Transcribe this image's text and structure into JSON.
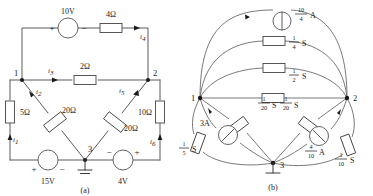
{
  "figure": {
    "panels": [
      {
        "id": "a",
        "caption": "(a)",
        "type": "resistive-network-with-voltage-sources",
        "nodes": [
          {
            "label": "1"
          },
          {
            "label": "2"
          },
          {
            "label": "3"
          }
        ],
        "sources": [
          {
            "name": "source-10v",
            "value": "10V",
            "plus": "+",
            "minus": "−",
            "orientation": "horizontal-top",
            "plus_side": "left"
          },
          {
            "name": "source-15v",
            "value": "15V",
            "plus": "+",
            "minus": "−",
            "orientation": "horizontal-bottom-left",
            "plus_side": "left"
          },
          {
            "name": "source-4v",
            "value": "4V",
            "plus": "+",
            "minus": "−",
            "orientation": "horizontal-bottom-right",
            "plus_side": "right"
          }
        ],
        "resistors": [
          {
            "name": "resistor-4ohm",
            "value": "4Ω"
          },
          {
            "name": "resistor-2ohm",
            "value": "2Ω"
          },
          {
            "name": "resistor-5ohm",
            "value": "5Ω"
          },
          {
            "name": "resistor-10ohm",
            "value": "10Ω"
          },
          {
            "name": "resistor-20ohm-left",
            "value": "20Ω"
          },
          {
            "name": "resistor-20ohm-right",
            "value": "20Ω"
          }
        ],
        "currents": [
          {
            "name": "current-i1",
            "symbol": "i",
            "sub": "1"
          },
          {
            "name": "current-i2",
            "symbol": "i",
            "sub": "2"
          },
          {
            "name": "current-i3",
            "symbol": "i",
            "sub": "3"
          },
          {
            "name": "current-i4",
            "symbol": "i",
            "sub": "4"
          },
          {
            "name": "current-i5",
            "symbol": "i",
            "sub": "5"
          },
          {
            "name": "current-i6",
            "symbol": "i",
            "sub": "6"
          }
        ],
        "ground": {
          "name": "ground-symbol",
          "at_node": "3"
        }
      },
      {
        "id": "b",
        "caption": "(b)",
        "type": "conductance-network-with-current-sources",
        "nodes": [
          {
            "label": "1"
          },
          {
            "label": "2"
          },
          {
            "label": "3"
          }
        ],
        "sources": [
          {
            "name": "current-source-10-over-4",
            "num": "10",
            "den": "4",
            "unit": "A",
            "position": "top-arc"
          },
          {
            "name": "current-source-3a",
            "value": "3A",
            "position": "left-lower-diagonal"
          },
          {
            "name": "current-source-4-over-10",
            "num": "4",
            "den": "10",
            "unit": "A",
            "position": "right-lower-diagonal"
          }
        ],
        "conductances": [
          {
            "name": "conductance-1-over-4",
            "num": "1",
            "den": "4",
            "unit": "S",
            "position": "upper-arc-1-2"
          },
          {
            "name": "conductance-1-over-2",
            "num": "1",
            "den": "2",
            "unit": "S",
            "position": "middle-1-2"
          },
          {
            "name": "conductance-1-over-20-left",
            "num": "1",
            "den": "20",
            "unit": "S",
            "position": "diagonal-1-3"
          },
          {
            "name": "conductance-1-over-20-right",
            "num": "1",
            "den": "20",
            "unit": "S",
            "position": "diagonal-2-3"
          },
          {
            "name": "conductance-1-over-5",
            "num": "1",
            "den": "5",
            "unit": "S",
            "position": "left-outer-arc"
          },
          {
            "name": "conductance-1-over-10",
            "num": "1",
            "den": "10",
            "unit": "S",
            "position": "right-outer-arc"
          }
        ],
        "ground": {
          "name": "ground-symbol",
          "at_node": "3"
        }
      }
    ]
  },
  "colors": {
    "wire": "#5a5a5a",
    "text": "#1a1a1a",
    "component_fill": "#ffffff",
    "background": "#ffffff"
  }
}
